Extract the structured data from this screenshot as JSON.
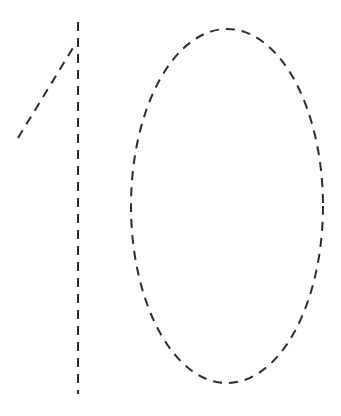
{
  "canvas": {
    "width": 341,
    "height": 416,
    "background_color": "#ffffff",
    "description": "Handwritten-style number rendered as dashed outline strokes on a plain white background"
  },
  "style": {
    "stroke_color": "#2b2b33",
    "stroke_width": 2,
    "dash_length": 9,
    "gap_length": 7,
    "dash_array": "9 7"
  },
  "figure": {
    "title": "10",
    "reading": "10",
    "glyph_count": 2,
    "glyphs": [
      {
        "name": "digit-one",
        "character": "1",
        "strokes": [
          {
            "name": "one-stem",
            "type": "line",
            "d": "M 78 22 L 78 394",
            "x1": 78,
            "y1": 22,
            "x2": 78,
            "y2": 394
          },
          {
            "name": "one-flag",
            "type": "line",
            "d": "M 18 138 L 76 43",
            "x1": 18,
            "y1": 138,
            "x2": 76,
            "y2": 43
          }
        ]
      },
      {
        "name": "digit-zero",
        "character": "0",
        "strokes": [
          {
            "name": "zero-ellipse",
            "type": "ellipse",
            "cx": 227,
            "cy": 206,
            "rx": 96,
            "ry": 177
          }
        ]
      }
    ]
  }
}
